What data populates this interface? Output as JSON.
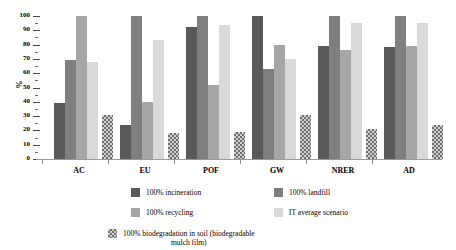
{
  "chart_data": {
    "type": "bar",
    "title": "",
    "subtitle": "",
    "xlabel": "",
    "ylabel": "%",
    "ylim": [
      0,
      100
    ],
    "yticks": [
      0,
      10,
      20,
      30,
      40,
      50,
      60,
      70,
      80,
      90,
      100
    ],
    "ytick_labels": [
      "0",
      "10",
      "20",
      "30",
      "40",
      "50",
      "60",
      "70",
      "80",
      "90",
      "100"
    ],
    "grid": false,
    "legend_position": "below",
    "categories": [
      "AC",
      "EU",
      "POF",
      "GW",
      "NRER",
      "AD"
    ],
    "series": [
      {
        "name": "100% incineration",
        "color": "#595959",
        "values": [
          39,
          24,
          92,
          100,
          79,
          78
        ]
      },
      {
        "name": "100% landfill",
        "color": "#7f7f7f",
        "values": [
          69,
          100,
          100,
          63,
          100,
          100
        ]
      },
      {
        "name": "100% recycling",
        "color": "#a6a6a6",
        "values": [
          100,
          40,
          52,
          80,
          76,
          79
        ]
      },
      {
        "name": "IT average scenario",
        "color": "#d9d9d9",
        "values": [
          68,
          83,
          94,
          70,
          95,
          95
        ]
      },
      {
        "name": "100% biodegradation in soil (biodegradable\nmulch film)",
        "color": "#d0d0d0",
        "pattern": "checkerboard",
        "values": [
          30.5,
          18,
          19,
          30.5,
          21,
          24
        ]
      }
    ]
  },
  "legend": {
    "items": [
      {
        "label": "100% incineration",
        "swatch": "swatch-incineration"
      },
      {
        "label": "100% landfill",
        "swatch": "swatch-landfill"
      },
      {
        "label": "100% recycling",
        "swatch": "swatch-recycling"
      },
      {
        "label": "IT average scenario",
        "swatch": "swatch-itaverage"
      },
      {
        "label": "100% biodegradation in soil (biodegradable\nmulch film)",
        "swatch": "swatch-biodeg"
      }
    ]
  }
}
